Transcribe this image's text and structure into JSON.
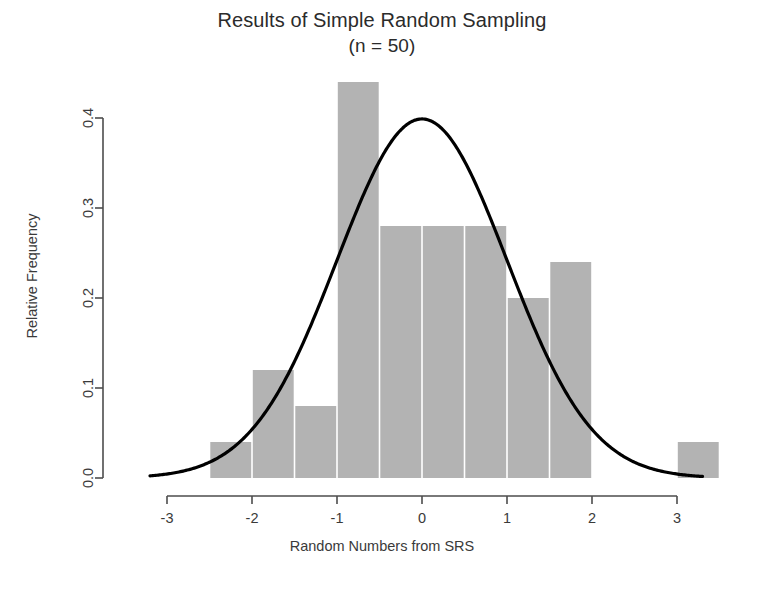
{
  "title": {
    "line1": "Results of Simple Random Sampling",
    "line2": "(n = 50)"
  },
  "axes": {
    "xlabel": "Random Numbers from SRS",
    "ylabel": "Relative Frequency",
    "xticks": [
      "-3",
      "-2",
      "-1",
      "0",
      "1",
      "2",
      "3"
    ],
    "yticks": [
      "0.0",
      "0.1",
      "0.2",
      "0.3",
      "0.4"
    ]
  },
  "colors": {
    "bar_fill": "#b3b3b3",
    "curve": "#000000",
    "axis": "#4d4d4d",
    "text": "#3a3a3a",
    "background": "#ffffff"
  },
  "chart_data": {
    "type": "bar",
    "title": "Results of Simple Random Sampling (n = 50)",
    "xlabel": "Random Numbers from SRS",
    "ylabel": "Relative Frequency",
    "xlim": [
      -3.2,
      3.6
    ],
    "ylim": [
      0.0,
      0.44
    ],
    "xticks": [
      -3,
      -2,
      -1,
      0,
      1,
      2,
      3
    ],
    "yticks": [
      0.0,
      0.1,
      0.2,
      0.3,
      0.4
    ],
    "grid": false,
    "legend": null,
    "bin_width": 0.5,
    "bins": [
      {
        "left": -2.5,
        "right": -2.0,
        "value": 0.04
      },
      {
        "left": -2.0,
        "right": -1.5,
        "value": 0.12
      },
      {
        "left": -1.5,
        "right": -1.0,
        "value": 0.08
      },
      {
        "left": -1.0,
        "right": -0.5,
        "value": 0.44
      },
      {
        "left": -0.5,
        "right": 0.0,
        "value": 0.28
      },
      {
        "left": 0.0,
        "right": 0.5,
        "value": 0.28
      },
      {
        "left": 0.5,
        "right": 1.0,
        "value": 0.28
      },
      {
        "left": 1.0,
        "right": 1.5,
        "value": 0.2
      },
      {
        "left": 1.5,
        "right": 2.0,
        "value": 0.24
      },
      {
        "left": 3.0,
        "right": 3.5,
        "value": 0.04
      }
    ],
    "overlay_curve": {
      "name": "normal density",
      "mean": 0,
      "sd": 1,
      "peak": 0.4,
      "x_range": [
        -3.2,
        3.3
      ]
    }
  }
}
